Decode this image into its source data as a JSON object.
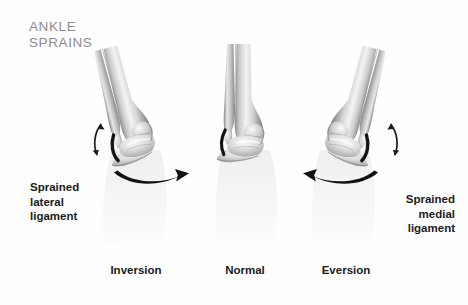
{
  "figure": {
    "title": "ANKLE\nSPRAINS",
    "title_color": "#8c8c8c",
    "background_color": "#fefefe",
    "ink_color": "#1b1b1b",
    "bone_light": "#f2f2f2",
    "bone_mid": "#b9b9b9",
    "bone_dark": "#6e6e6e",
    "ligament_color": "#121212"
  },
  "annotations": {
    "lateral": {
      "text": "Sprained\nlateral\nligament",
      "align": "left"
    },
    "medial": {
      "text": "Sprained\nmedial\nligament",
      "align": "right"
    }
  },
  "panels": [
    {
      "id": "inversion",
      "label": "Inversion",
      "tilt_degrees": -14,
      "motion_arrow": "large-curved-arrow-right",
      "ligament_side": "lateral",
      "small_arrow": "double-headed-curved-arrow-left"
    },
    {
      "id": "normal",
      "label": "Normal",
      "tilt_degrees": 0,
      "motion_arrow": "none",
      "ligament_side": "lateral",
      "small_arrow": "none"
    },
    {
      "id": "eversion",
      "label": "Eversion",
      "tilt_degrees": 14,
      "motion_arrow": "large-curved-arrow-left",
      "ligament_side": "medial",
      "small_arrow": "double-headed-curved-arrow-right"
    }
  ]
}
